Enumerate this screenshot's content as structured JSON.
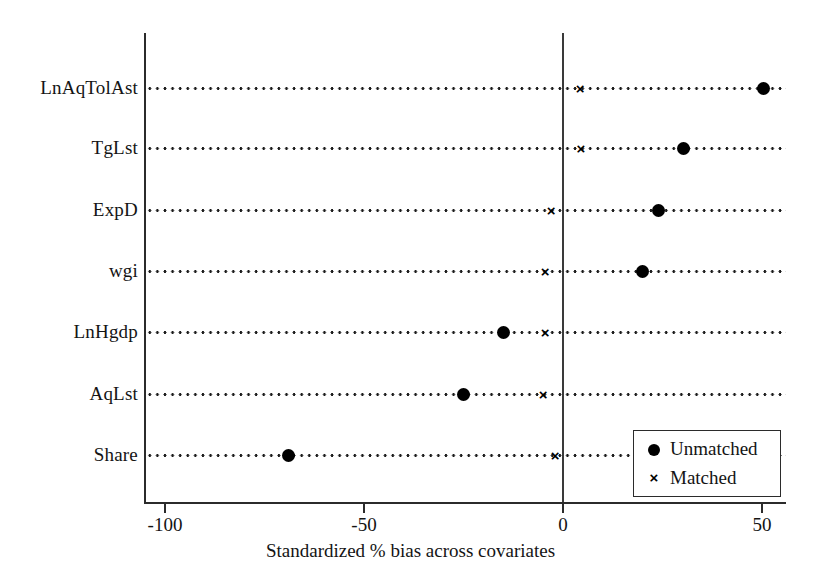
{
  "chart_data": {
    "type": "scatter",
    "title": "",
    "xlabel": "Standardized % bias across covariates",
    "ylabel": "",
    "xlim": [
      -115,
      56
    ],
    "xticks": [
      -100,
      -50,
      0,
      50
    ],
    "xtick_labels": [
      "-100",
      "-50",
      "0",
      "50"
    ],
    "grid": "horizontal-dotted-per-category",
    "reference_line_x": 0,
    "categories": [
      "LnAqTolAst",
      "TgLst",
      "ExpD",
      "wgi",
      "LnHgdp",
      "AqLst",
      "Share"
    ],
    "legend_position": "bottom-right",
    "series": [
      {
        "name": "Unmatched",
        "marker": "filled-circle",
        "symbol": "●",
        "color": "#000000",
        "values": [
          50.5,
          30.2,
          24.0,
          20.0,
          -15.0,
          -25.0,
          -69.0
        ]
      },
      {
        "name": "Matched",
        "marker": "cross",
        "symbol": "×",
        "color": "#000000",
        "values": [
          4.3,
          4.5,
          -3.0,
          -4.5,
          -4.5,
          -5.0,
          -2.0
        ]
      }
    ]
  },
  "axis": {
    "x_title": "Standardized % bias across covariates"
  },
  "legend": {
    "items": [
      {
        "label": "Unmatched",
        "symbol": "circle"
      },
      {
        "label": "Matched",
        "symbol": "cross"
      }
    ]
  }
}
